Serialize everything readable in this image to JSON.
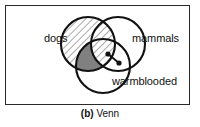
{
  "figure": {
    "caption_tag": "(b)",
    "caption_text": "Venn",
    "frame_color": "#2a2a2a",
    "background": "#ffffff"
  },
  "diagram": {
    "type": "venn",
    "set_count": 3,
    "stroke_color": "#111111",
    "hatch_color": "#555555",
    "shaded_fill": "#808080",
    "sets": [
      {
        "id": "dogs",
        "label": "dogs",
        "label_x": 38,
        "label_y": 36,
        "cx": 82,
        "cy": 38,
        "r": 27,
        "fill": "hatched"
      },
      {
        "id": "mammals",
        "label": "mammals",
        "label_x": 126,
        "label_y": 36,
        "cx": 112,
        "cy": 38,
        "r": 27,
        "fill": "none"
      },
      {
        "id": "warmblooded",
        "label": "warmblooded",
        "label_x": 106,
        "label_y": 78,
        "cx": 97,
        "cy": 60,
        "r": 27,
        "fill": "none"
      }
    ],
    "shaded_region": {
      "name": "dogs-and-warmblooded-not-mammals",
      "fill": "#808080"
    },
    "markers": [
      {
        "name": "element-dot-1",
        "cx": 102,
        "cy": 48,
        "r": 2.2
      },
      {
        "name": "element-dot-2",
        "cx": 113,
        "cy": 57,
        "r": 2.2
      }
    ],
    "connector": {
      "name": "element-link",
      "x1": 102,
      "y1": 48,
      "x2": 113,
      "y2": 57
    }
  }
}
